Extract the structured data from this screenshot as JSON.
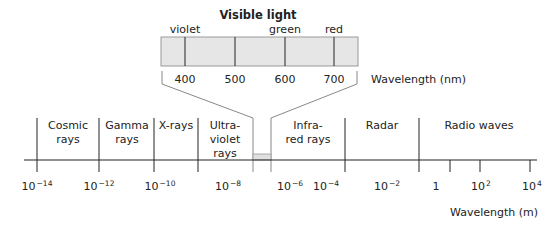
{
  "visible_light": {
    "title": "Visible light",
    "color_labels": [
      {
        "label": "violet",
        "x": 185
      },
      {
        "label": "green",
        "x": 285
      },
      {
        "label": "red",
        "x": 334
      }
    ],
    "ticks": [
      {
        "label": "400",
        "x": 185
      },
      {
        "label": "500",
        "x": 235
      },
      {
        "label": "600",
        "x": 285
      },
      {
        "label": "700",
        "x": 334
      }
    ],
    "axis_label": "Wavelength (nm)"
  },
  "spectrum": {
    "bands": [
      {
        "label": "Cosmic\nrays",
        "x": 68
      },
      {
        "label": "Gamma\nrays",
        "x": 127
      },
      {
        "label": "X-rays",
        "x": 176
      },
      {
        "label": "Ultra-\nviolet\nrays",
        "x": 225
      },
      {
        "label": "Infra-\nred rays",
        "x": 308
      },
      {
        "label": "Radar",
        "x": 382
      },
      {
        "label": "Radio waves",
        "x": 479
      }
    ],
    "ticks": [
      {
        "label": "10",
        "exp": "−14",
        "x": 37
      },
      {
        "label": "10",
        "exp": "−12",
        "x": 99
      },
      {
        "label": "10",
        "exp": "−10",
        "x": 160
      },
      {
        "label": "10",
        "exp": "−8",
        "x": 228
      },
      {
        "label": "10",
        "exp": "−6",
        "x": 290
      },
      {
        "label": "10",
        "exp": "−4",
        "x": 326
      },
      {
        "label": "10",
        "exp": "−2",
        "x": 387
      },
      {
        "label": "1",
        "exp": "",
        "x": 436
      },
      {
        "label": "10",
        "exp": "2",
        "x": 481
      },
      {
        "label": "10",
        "exp": "4",
        "x": 532
      }
    ],
    "axis_label": "Wavelength (m)"
  },
  "colors": {
    "line": "#222222",
    "band_fill": "#e6e6e6",
    "connector": "#888888"
  }
}
